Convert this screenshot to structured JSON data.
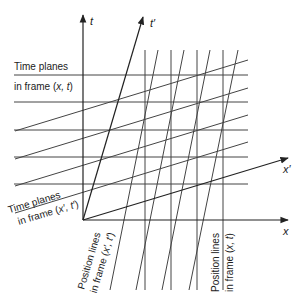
{
  "diagram": {
    "axes": {
      "t": "t",
      "t_prime": "t′",
      "x": "x",
      "x_prime": "x′"
    },
    "labels": {
      "time_planes_xt_line1": "Time planes",
      "time_planes_xt_line2_prefix": "in frame (",
      "time_planes_xt_line2_vars": "x, t",
      "time_planes_xt_line2_suffix": ")",
      "time_planes_xpt_line1": "Time planes",
      "time_planes_xpt_line2_prefix": "in frame (",
      "time_planes_xpt_line2_vars": "x′, t′",
      "time_planes_xpt_line2_suffix": ")",
      "position_lines_xpt_line1": "Position lines",
      "position_lines_xpt_line2_prefix": "in frame (",
      "position_lines_xpt_line2_vars": "x′, t′",
      "position_lines_xpt_line2_suffix": ")",
      "position_lines_xt_line1": "Position lines",
      "position_lines_xt_line2_prefix": "in frame (",
      "position_lines_xt_line2_vars": "x, t",
      "position_lines_xt_line2_suffix": ")"
    },
    "colors": {
      "line": "#333333",
      "background": "#ffffff"
    }
  }
}
